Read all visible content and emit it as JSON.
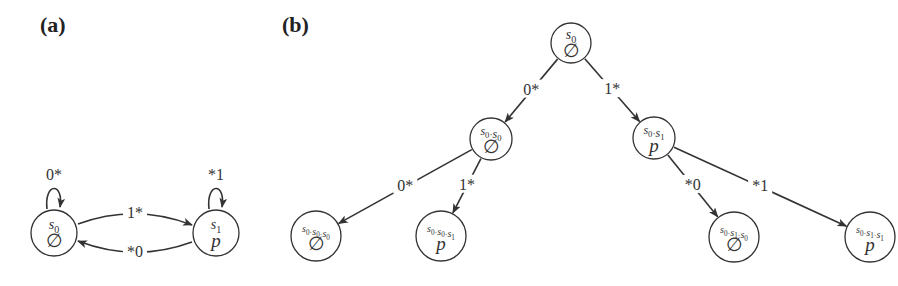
{
  "panels": {
    "a": {
      "label": "(a)",
      "nodes": [
        {
          "id": "s0",
          "top": "s0",
          "bottom": "∅",
          "x": 54,
          "y": 233,
          "r": 23
        },
        {
          "id": "s1",
          "top": "s1",
          "bottom": "p",
          "x": 216,
          "y": 233,
          "r": 23
        }
      ],
      "edges": [
        {
          "from": "s0",
          "to": "s0",
          "label": "0*"
        },
        {
          "from": "s1",
          "to": "s1",
          "label": "*1"
        },
        {
          "from": "s0",
          "to": "s1",
          "label": "1*"
        },
        {
          "from": "s1",
          "to": "s0",
          "label": "*0"
        }
      ]
    },
    "b": {
      "label": "(b)",
      "nodes": [
        {
          "id": "n0",
          "top": "s0",
          "bottom": "∅",
          "x": 571,
          "y": 43,
          "r": 20
        },
        {
          "id": "n1",
          "top": "s0·s0",
          "bottom": "∅",
          "x": 491,
          "y": 139,
          "r": 21
        },
        {
          "id": "n2",
          "top": "s0·s1",
          "bottom": "p",
          "x": 654,
          "y": 138,
          "r": 21
        },
        {
          "id": "n3",
          "top": "s0·s0·s0",
          "bottom": "∅",
          "x": 316,
          "y": 236,
          "r": 25
        },
        {
          "id": "n4",
          "top": "s0·s0·s1",
          "bottom": "p",
          "x": 441,
          "y": 236,
          "r": 25
        },
        {
          "id": "n5",
          "top": "s0·s1·s0",
          "bottom": "∅",
          "x": 734,
          "y": 237,
          "r": 25
        },
        {
          "id": "n6",
          "top": "s0·s1·s1",
          "bottom": "p",
          "x": 870,
          "y": 237,
          "r": 25
        }
      ],
      "edges": [
        {
          "from": "n0",
          "to": "n1",
          "label": "0*"
        },
        {
          "from": "n0",
          "to": "n2",
          "label": "1*"
        },
        {
          "from": "n1",
          "to": "n3",
          "label": "0*"
        },
        {
          "from": "n1",
          "to": "n4",
          "label": "1*"
        },
        {
          "from": "n2",
          "to": "n5",
          "label": "*0"
        },
        {
          "from": "n2",
          "to": "n6",
          "label": "*1"
        }
      ]
    }
  }
}
